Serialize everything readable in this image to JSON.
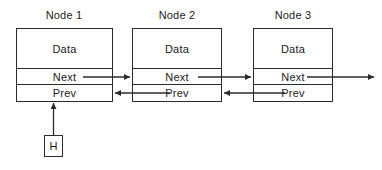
{
  "diagram": {
    "title_hidden": "",
    "stroke_color": "#2b2b2b",
    "text_color": "#1a1a1a",
    "background": "#ffffff",
    "nodes": [
      {
        "title": "Node 1",
        "cells": [
          {
            "label": "Data"
          },
          {
            "label": "Next"
          },
          {
            "label": "Prev"
          }
        ]
      },
      {
        "title": "Node 2",
        "cells": [
          {
            "label": "Data"
          },
          {
            "label": "Next"
          },
          {
            "label": "Prev"
          }
        ]
      },
      {
        "title": "Node 3",
        "cells": [
          {
            "label": "Data"
          },
          {
            "label": "Next"
          },
          {
            "label": "Prev"
          }
        ]
      }
    ],
    "head_pointer": {
      "label": "H"
    },
    "connectors": [
      {
        "name": "node1-next-to-node2",
        "direction": "right"
      },
      {
        "name": "node2-prev-to-node1",
        "direction": "left"
      },
      {
        "name": "node2-next-to-node3",
        "direction": "right"
      },
      {
        "name": "node3-prev-to-node2",
        "direction": "left"
      },
      {
        "name": "node3-next-to-null",
        "direction": "right"
      },
      {
        "name": "head-to-node1-prev",
        "direction": "up"
      }
    ]
  }
}
